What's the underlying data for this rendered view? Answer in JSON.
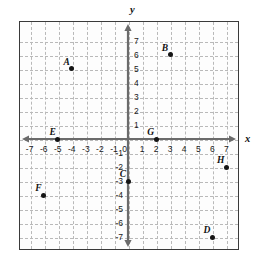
{
  "chart_data": {
    "type": "scatter",
    "title": "",
    "xlabel": "x",
    "ylabel": "y",
    "xlim": [
      -7.8,
      7.8
    ],
    "ylim": [
      -7.8,
      7.8
    ],
    "grid": true,
    "legend": "none",
    "x_ticks": [
      -7,
      -6,
      -5,
      -4,
      -3,
      -2,
      -1,
      0,
      1,
      2,
      3,
      4,
      5,
      6,
      7
    ],
    "y_ticks": [
      7,
      6,
      5,
      4,
      3,
      2,
      1,
      0,
      -1,
      -2,
      -3,
      -4,
      -5,
      -6,
      -7
    ],
    "x_tick_labels": [
      "-7",
      "-6",
      "-5",
      "-4",
      "-3",
      "-2",
      "-1",
      "0",
      "1",
      "2",
      "3",
      "4",
      "5",
      "6",
      "7"
    ],
    "y_tick_labels": [
      "7",
      "6",
      "5",
      "4",
      "3",
      "2",
      "1",
      "0",
      "-1",
      "-2",
      "-3",
      "-4",
      "-5",
      "-6",
      "-7"
    ],
    "points": [
      {
        "label": "A",
        "x": -4,
        "y": 5
      },
      {
        "label": "B",
        "x": 3,
        "y": 6
      },
      {
        "label": "C",
        "x": 0,
        "y": -3
      },
      {
        "label": "D",
        "x": 6,
        "y": -7
      },
      {
        "label": "E",
        "x": -5,
        "y": 0
      },
      {
        "label": "F",
        "x": -6,
        "y": -4
      },
      {
        "label": "G",
        "x": 2,
        "y": 0
      },
      {
        "label": "H",
        "x": 7,
        "y": -2
      }
    ],
    "colors": {
      "point": "#151515",
      "axis": "#6b6b6b",
      "grid": "#b9b9b9",
      "frame": "#3a3a3a",
      "background": "#fdfdfd"
    }
  }
}
